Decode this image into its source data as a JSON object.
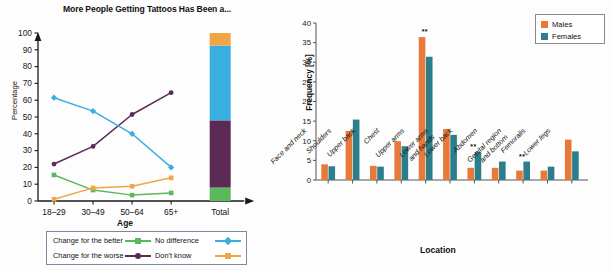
{
  "figure": {
    "left_panel": {
      "title": "More People Getting Tattoos Has Been a...",
      "ylabel": "Percentage",
      "xlabel": "Age",
      "legend": {
        "better_label": "Change for the better",
        "worse_label": "Change for the worse",
        "nodiff_label": "No difference",
        "dontknow_label": "Don't know"
      },
      "total_tick": "Total"
    },
    "right_panel": {
      "ylabel": "Frequency [%]",
      "xlabel": "Location",
      "legend": {
        "males_label": "Males",
        "females_label": "Females"
      },
      "significance_marker": "**"
    }
  },
  "chart_data": [
    {
      "type": "line",
      "title": "More People Getting Tattoos Has Been a...",
      "xlabel": "Age",
      "ylabel": "Percentage",
      "ylim": [
        0,
        100
      ],
      "yticks": [
        0,
        10,
        20,
        30,
        40,
        50,
        60,
        70,
        80,
        90,
        100
      ],
      "categories": [
        "18–29",
        "30–49",
        "50–64",
        "65+"
      ],
      "grid": false,
      "legend_position": "below-axes",
      "series": [
        {
          "name": "Change for the better",
          "color": "#5cb85c",
          "values": [
            15.5,
            6.5,
            3.5,
            4.8
          ]
        },
        {
          "name": "Change for the worse",
          "color": "#5b2a55",
          "values": [
            22.0,
            32.5,
            51.5,
            64.5
          ]
        },
        {
          "name": "No difference",
          "color": "#3aaee0",
          "values": [
            61.5,
            53.5,
            40.0,
            20.0
          ]
        },
        {
          "name": "Don't know",
          "color": "#f0a646",
          "values": [
            1.0,
            7.8,
            8.8,
            13.8
          ]
        }
      ],
      "stacked_total_bar": {
        "category": "Total",
        "segments": [
          {
            "name": "Change for the better",
            "color": "#5cb85c",
            "value": 8.0
          },
          {
            "name": "Change for the worse",
            "color": "#5b2a55",
            "value": 40.0
          },
          {
            "name": "No difference",
            "color": "#3aaee0",
            "value": 44.5
          },
          {
            "name": "Don't know",
            "color": "#f0a646",
            "value": 7.5
          }
        ]
      }
    },
    {
      "type": "bar",
      "title": "",
      "xlabel": "Location",
      "ylabel": "Frequency [%]",
      "ylim": [
        0,
        40
      ],
      "yticks": [
        0,
        5,
        10,
        15,
        20,
        25,
        30,
        35,
        40
      ],
      "grid": false,
      "legend_position": "top-right",
      "categories": [
        "Face and neck",
        "Shoulders",
        "Upper back",
        "Chest",
        "Upper arms",
        "Lower arms and hands",
        "Lower back",
        "Abdomen",
        "Genital region and bottom",
        "Femoralis",
        "Lower legs"
      ],
      "series": [
        {
          "name": "Males",
          "color": "#E8793A",
          "values": [
            4.0,
            12.5,
            3.6,
            9.9,
            36.4,
            13.0,
            3.1,
            3.1,
            2.4,
            2.4,
            10.3
          ]
        },
        {
          "name": "Females",
          "color": "#2B7F8C",
          "values": [
            3.5,
            15.4,
            3.4,
            8.6,
            31.4,
            11.5,
            7.1,
            4.7,
            4.7,
            3.4,
            7.3
          ]
        }
      ],
      "annotations": [
        {
          "category": "Upper arms",
          "text": "**"
        },
        {
          "category": "Lower back",
          "text": "**"
        },
        {
          "category": "Genital region and bottom",
          "text": "**"
        }
      ]
    }
  ]
}
